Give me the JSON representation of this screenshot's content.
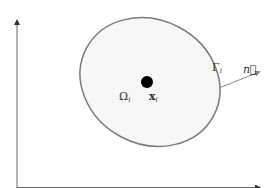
{
  "diagram": {
    "type": "domain-sketch",
    "colors": {
      "background": "#ffffff",
      "axis": "#666666",
      "boundary": "#7a7a7a",
      "region_fill": "#f7f7f7",
      "point": "#000000",
      "normal_arrow": "#8a8a8a",
      "text": "#333333"
    },
    "axes": {
      "vertical": {
        "x": 17,
        "y_top": 18,
        "y_bottom": 188,
        "arrow": "up"
      },
      "horizontal": {
        "y": 187,
        "x_left": 17,
        "x_right": 262,
        "arrow": "right"
      }
    },
    "region": {
      "shape": "ellipse",
      "cx": 150,
      "cy": 82,
      "rx": 72,
      "ry": 62,
      "rotation_deg": 28
    },
    "point": {
      "cx": 147,
      "cy": 82,
      "r": 6
    },
    "normal": {
      "x1": 219,
      "y1": 88,
      "x2": 261,
      "y2": 71
    },
    "labels": {
      "region_symbol": "Ω",
      "region_sub": "i",
      "point_symbol": "x",
      "point_sub": "i",
      "boundary_symbol": "Γ",
      "boundary_sub": "i",
      "normal_symbol": "n⃗"
    }
  }
}
